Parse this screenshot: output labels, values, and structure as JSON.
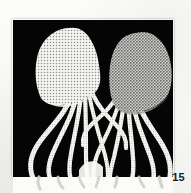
{
  "page": {
    "kind": "scanned-book-page",
    "background_color": "#fbfbfa",
    "folio": "15",
    "folio_color": "#1c1c1c"
  },
  "plate": {
    "name": "illustration-plate",
    "background_color": "#050505",
    "x": 13,
    "y": 20,
    "width": 160,
    "height": 157,
    "caption": ""
  },
  "artwork": {
    "title": "",
    "subject": "two jellyfish",
    "technique": "halftone screen print",
    "negative_space_letter": "V",
    "ink_color": "#050505",
    "paper_color": "#fbfbfa",
    "left_jellyfish": {
      "name": "left-jellyfish",
      "bell_tone": "#e6e6e3",
      "bell_tone_label": "light halftone",
      "tentacle_count": 6,
      "tentacle_tone": "#f2f2ef"
    },
    "right_jellyfish": {
      "name": "right-jellyfish",
      "bell_tone": "#a9a9a6",
      "bell_tone_label": "mid-grey crosshatch halftone",
      "tentacle_count": 6,
      "tentacle_tone": "#f2f2ef"
    }
  }
}
